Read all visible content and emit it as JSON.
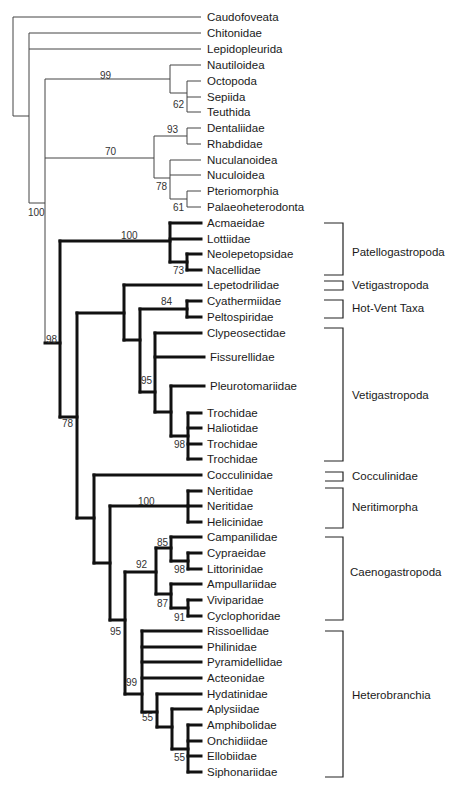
{
  "figure": {
    "type": "phylogenetic-tree",
    "taxa": [
      {
        "name": "Caudofoveata",
        "y": 17,
        "x": 203,
        "bold": false
      },
      {
        "name": "Chitonidae",
        "y": 33,
        "x": 203,
        "bold": false
      },
      {
        "name": "Lepidopleurida",
        "y": 49,
        "x": 203,
        "bold": false
      },
      {
        "name": "Nautiloidea",
        "y": 65,
        "x": 203,
        "bold": false
      },
      {
        "name": "Octopoda",
        "y": 81,
        "x": 203,
        "bold": false
      },
      {
        "name": "Sepiida",
        "y": 97,
        "x": 203,
        "bold": false
      },
      {
        "name": "Teuthida",
        "y": 112,
        "x": 203,
        "bold": false
      },
      {
        "name": "Dentaliidae",
        "y": 128,
        "x": 203,
        "bold": false
      },
      {
        "name": "Rhabdidae",
        "y": 144,
        "x": 203,
        "bold": false
      },
      {
        "name": "Nuculanoidea",
        "y": 160,
        "x": 203,
        "bold": false
      },
      {
        "name": "Nuculoidea",
        "y": 175,
        "x": 203,
        "bold": false
      },
      {
        "name": "Pteriomorphia",
        "y": 191,
        "x": 203,
        "bold": false
      },
      {
        "name": "Palaeoheterodonta",
        "y": 207,
        "x": 203,
        "bold": false
      },
      {
        "name": "Acmaeidae",
        "y": 223,
        "x": 203,
        "bold": true
      },
      {
        "name": "Lottiidae",
        "y": 239,
        "x": 203,
        "bold": true
      },
      {
        "name": "Neolepetopsidae",
        "y": 254,
        "x": 203,
        "bold": true
      },
      {
        "name": "Nacellidae",
        "y": 270,
        "x": 203,
        "bold": true
      },
      {
        "name": "Lepetodrilidae",
        "y": 285,
        "x": 203,
        "bold": true
      },
      {
        "name": "Cyathermiidae",
        "y": 301,
        "x": 203,
        "bold": true
      },
      {
        "name": "Peltospiridae",
        "y": 317,
        "x": 203,
        "bold": true
      },
      {
        "name": "Clypeosectidae",
        "y": 333,
        "x": 203,
        "bold": true
      },
      {
        "name": "Fissurellidae",
        "y": 357,
        "x": 206,
        "bold": true
      },
      {
        "name": "Pleurotomariidae",
        "y": 386,
        "x": 206,
        "bold": true
      },
      {
        "name": "Trochidae",
        "y": 413,
        "x": 203,
        "bold": true
      },
      {
        "name": "Haliotidae",
        "y": 428,
        "x": 203,
        "bold": true
      },
      {
        "name": "Trochidae",
        "y": 444,
        "x": 203,
        "bold": true
      },
      {
        "name": "Trochidae",
        "y": 459,
        "x": 203,
        "bold": true
      },
      {
        "name": "Cocculinidae",
        "y": 475,
        "x": 203,
        "bold": true
      },
      {
        "name": "Neritidae",
        "y": 491,
        "x": 203,
        "bold": true
      },
      {
        "name": "Neritidae",
        "y": 506,
        "x": 203,
        "bold": true
      },
      {
        "name": "Helicinidae",
        "y": 522,
        "x": 203,
        "bold": true
      },
      {
        "name": "Campanilidae",
        "y": 537,
        "x": 203,
        "bold": true
      },
      {
        "name": "Cypraeidae",
        "y": 553,
        "x": 203,
        "bold": true
      },
      {
        "name": "Littorinidae",
        "y": 569,
        "x": 203,
        "bold": true
      },
      {
        "name": "Ampullariidae",
        "y": 584,
        "x": 203,
        "bold": true
      },
      {
        "name": "Viviparidae",
        "y": 600,
        "x": 203,
        "bold": true
      },
      {
        "name": "Cyclophoridae",
        "y": 616,
        "x": 203,
        "bold": true
      },
      {
        "name": "Rissoellidae",
        "y": 631,
        "x": 203,
        "bold": true
      },
      {
        "name": "Philinidae",
        "y": 647,
        "x": 203,
        "bold": true
      },
      {
        "name": "Pyramidellidae",
        "y": 662,
        "x": 203,
        "bold": true
      },
      {
        "name": "Acteonidae",
        "y": 678,
        "x": 203,
        "bold": true
      },
      {
        "name": "Hydatinidae",
        "y": 694,
        "x": 203,
        "bold": true
      },
      {
        "name": "Aplysiidae",
        "y": 709,
        "x": 203,
        "bold": true
      },
      {
        "name": "Amphibolidae",
        "y": 725,
        "x": 203,
        "bold": true
      },
      {
        "name": "Onchidiidae",
        "y": 741,
        "x": 203,
        "bold": true
      },
      {
        "name": "Ellobiidae",
        "y": 756,
        "x": 203,
        "bold": true
      },
      {
        "name": "Siphonariidae",
        "y": 772,
        "x": 203,
        "bold": true
      }
    ],
    "support_values": [
      {
        "value": "99",
        "x": 100,
        "y": 79
      },
      {
        "value": "62",
        "x": 180,
        "y": 107
      },
      {
        "value": "93",
        "x": 172,
        "y": 133
      },
      {
        "value": "70",
        "x": 110,
        "y": 155
      },
      {
        "value": "78",
        "x": 160,
        "y": 190
      },
      {
        "value": "61",
        "x": 179,
        "y": 210
      },
      {
        "value": "100",
        "x": 34,
        "y": 216
      },
      {
        "value": "100",
        "x": 128,
        "y": 239
      },
      {
        "value": "73",
        "x": 179,
        "y": 273
      },
      {
        "value": "98",
        "x": 52,
        "y": 343
      },
      {
        "value": "84",
        "x": 166,
        "y": 305
      },
      {
        "value": "95",
        "x": 146,
        "y": 384
      },
      {
        "value": "78",
        "x": 68,
        "y": 427
      },
      {
        "value": "98",
        "x": 180,
        "y": 447
      },
      {
        "value": "100",
        "x": 145,
        "y": 505
      },
      {
        "value": "85",
        "x": 161,
        "y": 546
      },
      {
        "value": "92",
        "x": 141,
        "y": 568
      },
      {
        "value": "98",
        "x": 179,
        "y": 572
      },
      {
        "value": "87",
        "x": 162,
        "y": 607
      },
      {
        "value": "91",
        "x": 179,
        "y": 620
      },
      {
        "value": "95",
        "x": 116,
        "y": 635
      },
      {
        "value": "99",
        "x": 131,
        "y": 686
      },
      {
        "value": "55",
        "x": 147,
        "y": 721
      },
      {
        "value": "55",
        "x": 179,
        "y": 761
      }
    ],
    "groups": [
      {
        "name": "Patellogastropoda",
        "y_top": 223,
        "y_bottom": 275,
        "label_y": 252
      },
      {
        "name": "Vetigastropoda",
        "y_top": 280,
        "y_bottom": 290,
        "label_y": 289
      },
      {
        "name": "Hot-Vent Taxa",
        "y_top": 300,
        "y_bottom": 318,
        "label_y": 312
      },
      {
        "name": "Vetigastropoda",
        "y_top": 328,
        "y_bottom": 461,
        "label_y": 398
      },
      {
        "name": "Cocculinidae",
        "y_top": 471,
        "y_bottom": 481,
        "label_y": 480
      },
      {
        "name": "Neritimorpha",
        "y_top": 488,
        "y_bottom": 528,
        "label_y": 510
      },
      {
        "name": "Caenogastropoda",
        "y_top": 537,
        "y_bottom": 620,
        "label_y": 575
      },
      {
        "name": "Heterobranchia",
        "y_top": 631,
        "y_bottom": 777,
        "label_y": 699
      }
    ]
  }
}
